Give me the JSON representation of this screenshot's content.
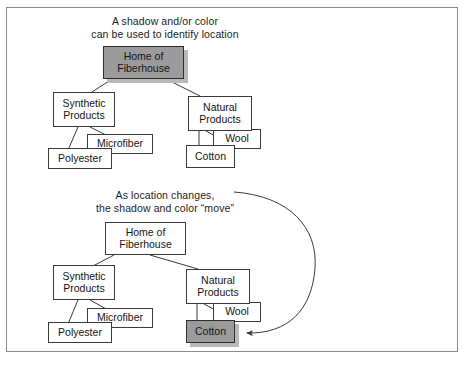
{
  "figure": {
    "accent_shaded_fill": "#9b9b9b",
    "shadow_color": "#b9b9b9",
    "line_color": "#3a3a3a",
    "frame_color": "#8a8a90",
    "background": "#ffffff"
  },
  "panels": [
    {
      "id": "top-panel",
      "caption": "A shadow and/or color\ncan be used to identify location",
      "nodes": [
        {
          "id": "home-of-fiberhouse",
          "label": "Home of\nFiberhouse",
          "shaded": true,
          "x": 103,
          "y": 46,
          "w": 81,
          "h": 33
        },
        {
          "id": "synthetic-products",
          "label": "Synthetic\nProducts",
          "shaded": false,
          "x": 53,
          "y": 92,
          "w": 62,
          "h": 35
        },
        {
          "id": "natural-products",
          "label": "Natural\nProducts",
          "shaded": false,
          "x": 188,
          "y": 96,
          "w": 64,
          "h": 35
        },
        {
          "id": "microfiber",
          "label": "Microfiber",
          "shaded": false,
          "x": 87,
          "y": 134,
          "w": 66,
          "h": 20
        },
        {
          "id": "polyester",
          "label": "Polyester",
          "shaded": false,
          "x": 48,
          "y": 148,
          "w": 64,
          "h": 21
        },
        {
          "id": "wool",
          "label": "Wool",
          "shaded": false,
          "x": 213,
          "y": 129,
          "w": 48,
          "h": 20
        },
        {
          "id": "cotton",
          "label": "Cotton",
          "shaded": false,
          "x": 186,
          "y": 145,
          "w": 49,
          "h": 23
        }
      ],
      "connectors": [
        {
          "from": "home-of-fiberhouse",
          "to": "synthetic-products"
        },
        {
          "from": "home-of-fiberhouse",
          "to": "natural-products"
        },
        {
          "from": "synthetic-products",
          "to": "microfiber"
        },
        {
          "from": "synthetic-products",
          "to": "polyester"
        },
        {
          "from": "natural-products",
          "to": "wool"
        },
        {
          "from": "natural-products",
          "to": "cotton"
        }
      ]
    },
    {
      "id": "bottom-panel",
      "caption": "As location changes,\nthe shadow and color “move”",
      "nodes": [
        {
          "id": "home-of-fiberhouse-2",
          "label": "Home of\nFiberhouse",
          "shaded": false,
          "x": 105,
          "y": 222,
          "w": 81,
          "h": 33
        },
        {
          "id": "synthetic-products-2",
          "label": "Synthetic\nProducts",
          "shaded": false,
          "x": 53,
          "y": 265,
          "w": 62,
          "h": 35
        },
        {
          "id": "natural-products-2",
          "label": "Natural\nProducts",
          "shaded": false,
          "x": 186,
          "y": 269,
          "w": 64,
          "h": 35
        },
        {
          "id": "microfiber-2",
          "label": "Microfiber",
          "shaded": false,
          "x": 87,
          "y": 308,
          "w": 66,
          "h": 20
        },
        {
          "id": "polyester-2",
          "label": "Polyester",
          "shaded": false,
          "x": 48,
          "y": 322,
          "w": 64,
          "h": 21
        },
        {
          "id": "wool-2",
          "label": "Wool",
          "shaded": false,
          "x": 213,
          "y": 302,
          "w": 48,
          "h": 20
        },
        {
          "id": "cotton-2",
          "label": "Cotton",
          "shaded": true,
          "x": 186,
          "y": 320,
          "w": 49,
          "h": 23
        }
      ],
      "connectors": [
        {
          "from": "home-of-fiberhouse-2",
          "to": "synthetic-products-2"
        },
        {
          "from": "home-of-fiberhouse-2",
          "to": "natural-products-2"
        },
        {
          "from": "synthetic-products-2",
          "to": "microfiber-2"
        },
        {
          "from": "synthetic-products-2",
          "to": "polyester-2"
        },
        {
          "from": "natural-products-2",
          "to": "wool-2"
        },
        {
          "from": "natural-products-2",
          "to": "cotton-2"
        }
      ],
      "annotation_arrow": {
        "id": "move-arrow",
        "description": "curved arrow sweeping right from the caption down to the shaded Cotton node",
        "target": "cotton-2"
      }
    }
  ]
}
